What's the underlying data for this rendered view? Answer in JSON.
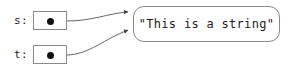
{
  "diagram": {
    "type": "object-reference-diagram",
    "background_color": "#ffffff",
    "line_color": "#555555",
    "border_color": "#8a8a8a",
    "text_color": "#1a1a1a",
    "dot_color": "#111111",
    "variables": [
      {
        "id": "s",
        "label": "s:",
        "box": {
          "x": 33,
          "y": 11,
          "width": 34,
          "height": 19
        },
        "pointer_dot": true,
        "points_to": "string-object"
      },
      {
        "id": "t",
        "label": "t:",
        "box": {
          "x": 33,
          "y": 45,
          "width": 34,
          "height": 19
        },
        "pointer_dot": true,
        "points_to": "string-object"
      }
    ],
    "objects": [
      {
        "id": "string-object",
        "value": "\"This is a string\"",
        "shape": "rounded-rectangle",
        "box": {
          "x": 133,
          "y": 6,
          "width": 147,
          "height": 36
        }
      }
    ],
    "arrows": [
      {
        "from": "s",
        "to": "string-object",
        "start": [
          67,
          21
        ],
        "end": [
          133,
          12
        ]
      },
      {
        "from": "t",
        "to": "string-object",
        "start": [
          67,
          55
        ],
        "end": [
          133,
          30
        ]
      }
    ]
  }
}
